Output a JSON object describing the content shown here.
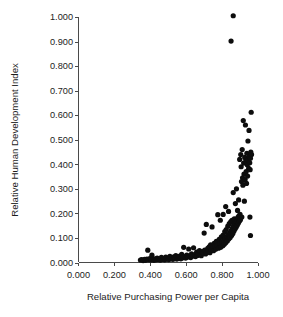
{
  "chart_data": {
    "type": "scatter",
    "title": "",
    "xlabel": "Relative Purchasing Power per Capita",
    "ylabel": "Relative Human Development Index",
    "xlim": [
      0.0,
      1.0
    ],
    "ylim": [
      0.0,
      1.0
    ],
    "xticks": [
      "0.000",
      "0.200",
      "0.400",
      "0.600",
      "0.800",
      "1.000"
    ],
    "xtick_values": [
      0.0,
      0.2,
      0.4,
      0.6,
      0.8,
      1.0
    ],
    "yticks": [
      "0.000",
      "0.100",
      "0.200",
      "0.300",
      "0.400",
      "0.500",
      "0.600",
      "0.700",
      "0.800",
      "0.900",
      "1.000"
    ],
    "ytick_values": [
      0.0,
      0.1,
      0.2,
      0.3,
      0.4,
      0.5,
      0.6,
      0.7,
      0.8,
      0.9,
      1.0
    ],
    "grid": false,
    "legend": null,
    "marker": {
      "shape": "circle",
      "color": "#0d0d0d",
      "size": 2.6
    },
    "series": [
      {
        "name": "countries",
        "points": [
          [
            0.345,
            0.01
          ],
          [
            0.352,
            0.012
          ],
          [
            0.36,
            0.008
          ],
          [
            0.368,
            0.013
          ],
          [
            0.374,
            0.009
          ],
          [
            0.381,
            0.014
          ],
          [
            0.386,
            0.05
          ],
          [
            0.39,
            0.011
          ],
          [
            0.397,
            0.016
          ],
          [
            0.403,
            0.01
          ],
          [
            0.409,
            0.03
          ],
          [
            0.414,
            0.013
          ],
          [
            0.42,
            0.009
          ],
          [
            0.427,
            0.015
          ],
          [
            0.433,
            0.011
          ],
          [
            0.438,
            0.018
          ],
          [
            0.444,
            0.012
          ],
          [
            0.45,
            0.014
          ],
          [
            0.456,
            0.01
          ],
          [
            0.462,
            0.021
          ],
          [
            0.468,
            0.013
          ],
          [
            0.474,
            0.016
          ],
          [
            0.48,
            0.011
          ],
          [
            0.486,
            0.022
          ],
          [
            0.492,
            0.014
          ],
          [
            0.497,
            0.018
          ],
          [
            0.503,
            0.012
          ],
          [
            0.509,
            0.025
          ],
          [
            0.514,
            0.015
          ],
          [
            0.52,
            0.019
          ],
          [
            0.526,
            0.013
          ],
          [
            0.531,
            0.023
          ],
          [
            0.537,
            0.016
          ],
          [
            0.542,
            0.028
          ],
          [
            0.548,
            0.014
          ],
          [
            0.553,
            0.02
          ],
          [
            0.559,
            0.017
          ],
          [
            0.564,
            0.026
          ],
          [
            0.57,
            0.015
          ],
          [
            0.575,
            0.033
          ],
          [
            0.581,
            0.019
          ],
          [
            0.586,
            0.062
          ],
          [
            0.592,
            0.024
          ],
          [
            0.597,
            0.018
          ],
          [
            0.603,
            0.03
          ],
          [
            0.608,
            0.022
          ],
          [
            0.614,
            0.055
          ],
          [
            0.619,
            0.027
          ],
          [
            0.625,
            0.02
          ],
          [
            0.63,
            0.035
          ],
          [
            0.636,
            0.026
          ],
          [
            0.641,
            0.06
          ],
          [
            0.647,
            0.031
          ],
          [
            0.652,
            0.024
          ],
          [
            0.658,
            0.042
          ],
          [
            0.663,
            0.029
          ],
          [
            0.668,
            0.036
          ],
          [
            0.674,
            0.048
          ],
          [
            0.679,
            0.033
          ],
          [
            0.684,
            0.028
          ],
          [
            0.69,
            0.044
          ],
          [
            0.695,
            0.038
          ],
          [
            0.7,
            0.12
          ],
          [
            0.703,
            0.05
          ],
          [
            0.708,
            0.035
          ],
          [
            0.712,
            0.155
          ],
          [
            0.716,
            0.042
          ],
          [
            0.72,
            0.058
          ],
          [
            0.724,
            0.046
          ],
          [
            0.728,
            0.064
          ],
          [
            0.732,
            0.04
          ],
          [
            0.736,
            0.072
          ],
          [
            0.74,
            0.052
          ],
          [
            0.744,
            0.145
          ],
          [
            0.748,
            0.06
          ],
          [
            0.752,
            0.048
          ],
          [
            0.756,
            0.078
          ],
          [
            0.76,
            0.066
          ],
          [
            0.764,
            0.054
          ],
          [
            0.768,
            0.086
          ],
          [
            0.772,
            0.07
          ],
          [
            0.776,
            0.195
          ],
          [
            0.78,
            0.058
          ],
          [
            0.784,
            0.094
          ],
          [
            0.788,
            0.076
          ],
          [
            0.792,
            0.062
          ],
          [
            0.796,
            0.104
          ],
          [
            0.8,
            0.082
          ],
          [
            0.804,
            0.068
          ],
          [
            0.806,
            0.112
          ],
          [
            0.809,
            0.09
          ],
          [
            0.812,
            0.074
          ],
          [
            0.815,
            0.126
          ],
          [
            0.818,
            0.098
          ],
          [
            0.82,
            0.08
          ],
          [
            0.823,
            0.134
          ],
          [
            0.826,
            0.106
          ],
          [
            0.829,
            0.088
          ],
          [
            0.832,
            0.148
          ],
          [
            0.834,
            0.114
          ],
          [
            0.837,
            0.096
          ],
          [
            0.84,
            0.158
          ],
          [
            0.843,
            0.122
          ],
          [
            0.845,
            0.102
          ],
          [
            0.848,
            0.166
          ],
          [
            0.85,
            0.13
          ],
          [
            0.853,
            0.11
          ],
          [
            0.855,
            0.172
          ],
          [
            0.858,
            0.14
          ],
          [
            0.86,
            0.118
          ],
          [
            0.862,
            0.285
          ],
          [
            0.864,
            0.15
          ],
          [
            0.866,
            0.128
          ],
          [
            0.868,
            0.178
          ],
          [
            0.87,
            0.16
          ],
          [
            0.872,
            0.136
          ],
          [
            0.874,
            0.24
          ],
          [
            0.876,
            0.168
          ],
          [
            0.878,
            0.144
          ],
          [
            0.88,
            0.3
          ],
          [
            0.882,
            0.176
          ],
          [
            0.884,
            0.152
          ],
          [
            0.886,
            0.212
          ],
          [
            0.888,
            0.184
          ],
          [
            0.89,
            0.16
          ],
          [
            0.892,
            0.255
          ],
          [
            0.894,
            0.19
          ],
          [
            0.896,
            0.168
          ],
          [
            0.898,
            0.42
          ],
          [
            0.9,
            0.196
          ],
          [
            0.902,
            0.174
          ],
          [
            0.904,
            0.44
          ],
          [
            0.906,
            0.39
          ],
          [
            0.908,
            0.33
          ],
          [
            0.91,
            0.185
          ],
          [
            0.912,
            0.46
          ],
          [
            0.914,
            0.345
          ],
          [
            0.916,
            0.315
          ],
          [
            0.918,
            0.578
          ],
          [
            0.92,
            0.405
          ],
          [
            0.922,
            0.36
          ],
          [
            0.924,
            0.25
          ],
          [
            0.926,
            0.428
          ],
          [
            0.928,
            0.338
          ],
          [
            0.93,
            0.56
          ],
          [
            0.932,
            0.412
          ],
          [
            0.934,
            0.37
          ],
          [
            0.936,
            0.322
          ],
          [
            0.938,
            0.445
          ],
          [
            0.94,
            0.398
          ],
          [
            0.942,
            0.352
          ],
          [
            0.944,
            0.495
          ],
          [
            0.946,
            0.418
          ],
          [
            0.948,
            0.384
          ],
          [
            0.95,
            0.538
          ],
          [
            0.952,
            0.432
          ],
          [
            0.954,
            0.406
          ],
          [
            0.956,
            0.378
          ],
          [
            0.958,
            0.425
          ],
          [
            0.96,
            0.45
          ],
          [
            0.962,
            0.612
          ],
          [
            0.964,
            0.44
          ],
          [
            0.955,
            0.185
          ],
          [
            0.958,
            0.11
          ],
          [
            0.862,
            1.005
          ],
          [
            0.85,
            0.902
          ],
          [
            0.82,
            0.228
          ],
          [
            0.806,
            0.196
          ],
          [
            0.79,
            0.172
          ],
          [
            0.836,
            0.208
          ]
        ]
      }
    ]
  },
  "axes": {
    "x_title": "Relative Purchasing Power per Capita",
    "y_title": "Relative Human Development Index"
  }
}
